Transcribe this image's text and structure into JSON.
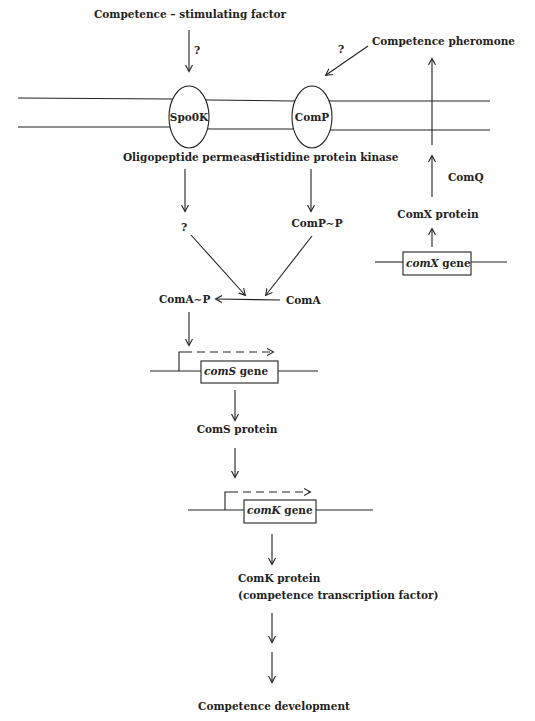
{
  "diagram": {
    "top_input": "Competence – stimulating  factor",
    "top_question": "?",
    "pheromone_label": "Competence pheromone",
    "pheromone_question": "?",
    "membrane_proteins": [
      {
        "name": "Spo0K",
        "caption": "Oligopeptide permease"
      },
      {
        "name": "ComP",
        "caption": "Histidine protein kinase"
      }
    ],
    "spo0k_product": "?",
    "comp_product": "ComP∼P",
    "coma_phospho": "ComA∼P",
    "coma": "ComA",
    "comq": "ComQ",
    "comx_protein": "ComX protein",
    "comx_gene": {
      "name": "comX",
      "suffix": " gene"
    },
    "coms_gene": {
      "name": "comS",
      "suffix": " gene"
    },
    "coms_protein": "ComS protein",
    "comk_gene": {
      "name": "comK",
      "suffix": " gene"
    },
    "comk_protein": "ComK protein",
    "comk_description": "(competence transcription factor)",
    "final_output": "Competence development"
  },
  "colors": {
    "ink": "#222222",
    "background": "#ffffff"
  }
}
